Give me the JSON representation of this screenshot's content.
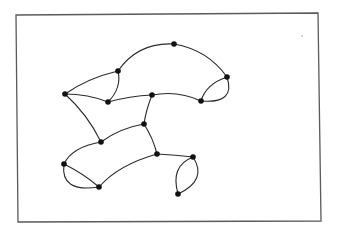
{
  "diagram": {
    "type": "planar-graph",
    "frame": {
      "points": "16,15 318,13 321,221 18,222",
      "color": "#5a5a5a"
    },
    "speck": {
      "x": 302,
      "y": 36,
      "r": 0.8
    },
    "node_color": "#111111",
    "edge_color": "#2a2a2a",
    "nodes": [
      {
        "id": "n1",
        "x": 65,
        "y": 94
      },
      {
        "id": "n2",
        "x": 118,
        "y": 71
      },
      {
        "id": "n3",
        "x": 108,
        "y": 102
      },
      {
        "id": "n4",
        "x": 174,
        "y": 44
      },
      {
        "id": "n5",
        "x": 227,
        "y": 77
      },
      {
        "id": "n6",
        "x": 201,
        "y": 101
      },
      {
        "id": "n7",
        "x": 152,
        "y": 95
      },
      {
        "id": "n8",
        "x": 144,
        "y": 124
      },
      {
        "id": "n9",
        "x": 101,
        "y": 142
      },
      {
        "id": "n10",
        "x": 157,
        "y": 154
      },
      {
        "id": "n11",
        "x": 64,
        "y": 164
      },
      {
        "id": "n12",
        "x": 99,
        "y": 187
      },
      {
        "id": "n13",
        "x": 193,
        "y": 157
      },
      {
        "id": "n14",
        "x": 178,
        "y": 194
      }
    ],
    "edges": [
      {
        "from": "n1",
        "to": "n2",
        "path": "M65,94 Q88,78 118,71"
      },
      {
        "from": "n1",
        "to": "n3",
        "path": "M65,94 Q88,94 108,102"
      },
      {
        "from": "n1",
        "to": "n9",
        "path": "M65,94 Q88,115 101,142"
      },
      {
        "from": "n2",
        "to": "n3",
        "path": "M118,71 Q122,88 108,102"
      },
      {
        "from": "n2",
        "to": "n4",
        "path": "M118,71 Q138,42 174,44"
      },
      {
        "from": "n4",
        "to": "n5",
        "path": "M174,44 Q208,50 227,77"
      },
      {
        "from": "n5",
        "to": "n6",
        "path": "M227,77 Q206,84 201,101"
      },
      {
        "from": "n5",
        "to": "n6",
        "path": "M227,77 Q236,104 201,101"
      },
      {
        "from": "n3",
        "to": "n7",
        "path": "M108,102 Q130,96 152,95"
      },
      {
        "from": "n7",
        "to": "n6",
        "path": "M152,95 Q178,90 201,101"
      },
      {
        "from": "n7",
        "to": "n8",
        "path": "M152,95 Q146,110 144,124"
      },
      {
        "from": "n8",
        "to": "n9",
        "path": "M144,124 Q120,128 101,142"
      },
      {
        "from": "n8",
        "to": "n10",
        "path": "M144,124 Q153,138 157,154"
      },
      {
        "from": "n9",
        "to": "n11",
        "path": "M101,142 Q72,147 64,164"
      },
      {
        "from": "n11",
        "to": "n12",
        "path": "M64,164 Q84,174 99,187"
      },
      {
        "from": "n11",
        "to": "n12",
        "path": "M64,164 Q60,193 99,187"
      },
      {
        "from": "n12",
        "to": "n10",
        "path": "M99,187 Q118,165 157,154"
      },
      {
        "from": "n10",
        "to": "n13",
        "path": "M157,154 Q176,155 193,157"
      },
      {
        "from": "n13",
        "to": "n14",
        "path": "M193,157 Q170,166 178,194"
      },
      {
        "from": "n13",
        "to": "n14",
        "path": "M193,157 Q208,180 178,194"
      }
    ]
  }
}
